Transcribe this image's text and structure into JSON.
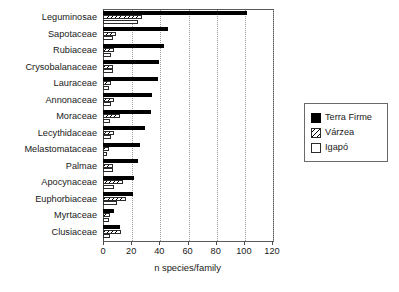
{
  "chart_data": {
    "type": "bar",
    "orientation": "horizontal",
    "title": "",
    "xlabel": "n species/family",
    "ylabel": "",
    "xlim": [
      0,
      120
    ],
    "xticks": [
      0,
      20,
      40,
      60,
      80,
      100,
      120
    ],
    "xtick_labels": [
      "0",
      "20",
      "40",
      "60",
      "80",
      "100",
      "120"
    ],
    "grid": "vertical-dotted",
    "legend_position": "right",
    "categories": [
      "Leguminosae",
      "Sapotaceae",
      "Rubiaceae",
      "Crysobalanaceae",
      "Lauraceae",
      "Annonaceae",
      "Moraceae",
      "Lecythidaceae",
      "Melastomataceae",
      "Palmae",
      "Apocynaceae",
      "Euphorbiaceae",
      "Myrtaceae",
      "Clusiaceae"
    ],
    "series": [
      {
        "name": "Terra Firme",
        "fill": "solid-black",
        "color": "#000000",
        "values": [
          102,
          46,
          43,
          40,
          39,
          35,
          34,
          30,
          26,
          25,
          22,
          21,
          8,
          12
        ]
      },
      {
        "name": "Várzea",
        "fill": "diagonal-hatch",
        "color": "#ffffff",
        "values": [
          28,
          9,
          8,
          7,
          6,
          8,
          12,
          8,
          4,
          7,
          14,
          16,
          5,
          13
        ]
      },
      {
        "name": "Igapó",
        "fill": "empty-white",
        "color": "#ffffff",
        "values": [
          25,
          7,
          6,
          7,
          4,
          6,
          5,
          6,
          3,
          7,
          8,
          10,
          4,
          5
        ]
      }
    ]
  },
  "legend": {
    "items": [
      {
        "label": "Terra Firme",
        "swatch": "terra"
      },
      {
        "label": "Várzea",
        "swatch": "varzea"
      },
      {
        "label": "Igapó",
        "swatch": "igapo"
      }
    ]
  }
}
